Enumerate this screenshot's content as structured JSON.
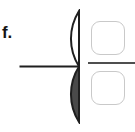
{
  "item": {
    "label": "f.",
    "prompt_type": "shade-fraction-write-fraction"
  },
  "figure": {
    "name": "half-disc-quarter-shaded",
    "shape": "semicircle",
    "orientation": "flat-edge-right",
    "total_parts": 2,
    "shaded_parts": 1,
    "fraction": "1/2",
    "parts": [
      {
        "name": "upper-quarter-circle",
        "shaded": false,
        "fill": "#ffffff"
      },
      {
        "name": "lower-quarter-circle",
        "shaded": true,
        "fill": "#4a4a4a"
      }
    ],
    "outline_color": "#1f1f1f",
    "shaded_color": "#4a4a4a",
    "unshaded_color": "#ffffff"
  },
  "answer": {
    "numerator_value": "",
    "denominator_value": "",
    "numerator_placeholder": "",
    "denominator_placeholder": "",
    "bar_color": "#4f4f4f",
    "box_border_color": "#c9c9c9"
  }
}
